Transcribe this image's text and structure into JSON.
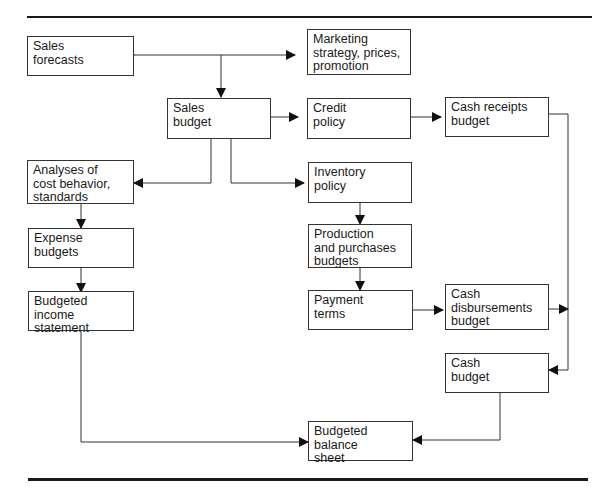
{
  "diagram": {
    "type": "flowchart",
    "title": "",
    "nodes": [
      {
        "id": "sales_forecasts",
        "label": "Sales\nforecasts"
      },
      {
        "id": "marketing",
        "label": "Marketing\nstrategy, prices,\npromotion"
      },
      {
        "id": "sales_budget",
        "label": "Sales\nbudget"
      },
      {
        "id": "credit_policy",
        "label": "Credit\npolicy"
      },
      {
        "id": "cash_receipts",
        "label": "Cash receipts\nbudget"
      },
      {
        "id": "cost_analyses",
        "label": "Analyses of\ncost behavior,\nstandards"
      },
      {
        "id": "inventory_policy",
        "label": "Inventory\npolicy"
      },
      {
        "id": "expense_budgets",
        "label": "Expense budgets"
      },
      {
        "id": "production_budgets",
        "label": "Production\nand purchases\nbudgets"
      },
      {
        "id": "income_statement",
        "label": "Budgeted income\nstatement"
      },
      {
        "id": "payment_terms",
        "label": "Payment\nterms"
      },
      {
        "id": "cash_disbursements",
        "label": "Cash\ndisbursements\nbudget"
      },
      {
        "id": "cash_budget",
        "label": "Cash\nbudget"
      },
      {
        "id": "balance_sheet",
        "label": "Budgeted\nbalance\nsheet"
      }
    ],
    "edges": [
      {
        "from": "sales_forecasts",
        "to": "marketing",
        "bidirectional": true
      },
      {
        "from": "sales_forecasts",
        "to": "sales_budget"
      },
      {
        "from": "sales_budget",
        "to": "credit_policy"
      },
      {
        "from": "credit_policy",
        "to": "cash_receipts"
      },
      {
        "from": "sales_budget",
        "to": "cost_analyses"
      },
      {
        "from": "sales_budget",
        "to": "inventory_policy"
      },
      {
        "from": "cost_analyses",
        "to": "expense_budgets"
      },
      {
        "from": "expense_budgets",
        "to": "income_statement"
      },
      {
        "from": "inventory_policy",
        "to": "production_budgets"
      },
      {
        "from": "production_budgets",
        "to": "payment_terms"
      },
      {
        "from": "payment_terms",
        "to": "cash_disbursements"
      },
      {
        "from": "cash_receipts",
        "to": "cash_budget"
      },
      {
        "from": "cash_disbursements",
        "to": "cash_budget"
      },
      {
        "from": "cash_budget",
        "to": "balance_sheet"
      },
      {
        "from": "income_statement",
        "to": "balance_sheet"
      }
    ]
  }
}
